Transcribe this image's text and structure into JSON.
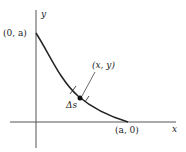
{
  "diagram": {
    "axes": {
      "x_label": "x",
      "y_label": "y"
    },
    "points": {
      "y_intercept": "(0, a)",
      "x_intercept": "(a, 0)",
      "point": "(x, y)"
    },
    "arc_element": "Δs",
    "colors": {
      "stroke": "#222222",
      "axis": "#555555"
    }
  }
}
